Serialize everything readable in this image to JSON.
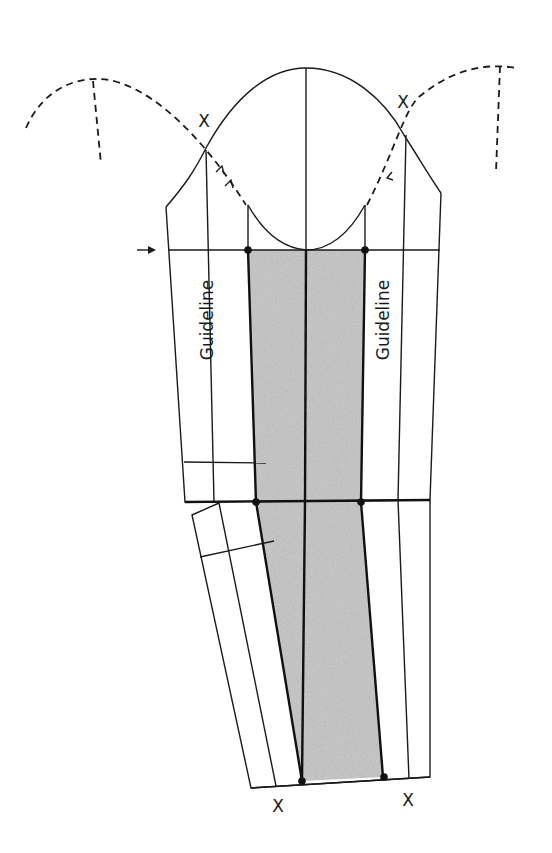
{
  "diagram": {
    "type": "sewing sleeve pattern draft",
    "labels": {
      "guideline_left": "Guideline",
      "guideline_right": "Guideline",
      "notch_cap_left": "X",
      "notch_cap_right": "X",
      "notch_hem_left": "X",
      "notch_hem_right": "X"
    },
    "colors": {
      "line": "#1a1a1a",
      "shaded_panel": "#c4c4c4",
      "background": "#ffffff"
    },
    "elements": [
      "sleeve cap curve",
      "dashed armhole curves (left and right)",
      "dashed reference lines",
      "biceps line with arrow marker",
      "elbow line",
      "shaded center panel",
      "center grain line",
      "guideline columns",
      "lower sleeve extension with hem",
      "dot markers at panel corners"
    ]
  }
}
